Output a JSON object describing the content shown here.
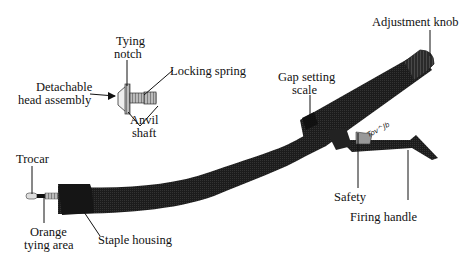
{
  "diagram": {
    "type": "labeled-illustration",
    "labels": {
      "adjustment_knob": "Adjustment knob",
      "tying_notch_line1": "Tying",
      "tying_notch_line2": "notch",
      "locking_spring": "Locking spring",
      "detachable_head_line1": "Detachable",
      "detachable_head_line2": "head assembly",
      "anvil_shaft_line1": "Anvil",
      "anvil_shaft_line2": "shaft",
      "gap_setting_line1": "Gap setting",
      "gap_setting_line2": "scale",
      "trocar": "Trocar",
      "orange_tying_line1": "Orange",
      "orange_tying_line2": "tying area",
      "staple_housing": "Staple housing",
      "safety": "Safety",
      "firing_handle": "Firing handle"
    },
    "handwritten_note": "Tov^Jb",
    "colors": {
      "device_body": "#1a1a1a",
      "background": "#ffffff",
      "leader_line": "#111111"
    }
  }
}
